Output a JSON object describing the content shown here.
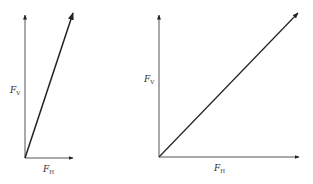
{
  "diagrams": [
    {
      "id": "left",
      "description": "Steep resultant: large vertical component, small horizontal component",
      "origin": [
        25,
        158
      ],
      "vertical_tip": [
        25,
        15
      ],
      "horizontal_tip": [
        73,
        158
      ],
      "resultant_tip": [
        73,
        13
      ],
      "labels": {
        "vertical": {
          "main": "F",
          "sub": "V"
        },
        "horizontal": {
          "main": "F",
          "sub": "H"
        }
      }
    },
    {
      "id": "right",
      "description": "45-degree resultant: equal vertical and horizontal components",
      "origin": [
        159,
        157
      ],
      "vertical_tip": [
        159,
        15
      ],
      "horizontal_tip": [
        299,
        157
      ],
      "resultant_tip": [
        298,
        13
      ],
      "labels": {
        "vertical": {
          "main": "F",
          "sub": "V"
        },
        "horizontal": {
          "main": "F",
          "sub": "H"
        }
      }
    }
  ],
  "colors": {
    "stroke": "#333333",
    "arrow": "#222222"
  }
}
